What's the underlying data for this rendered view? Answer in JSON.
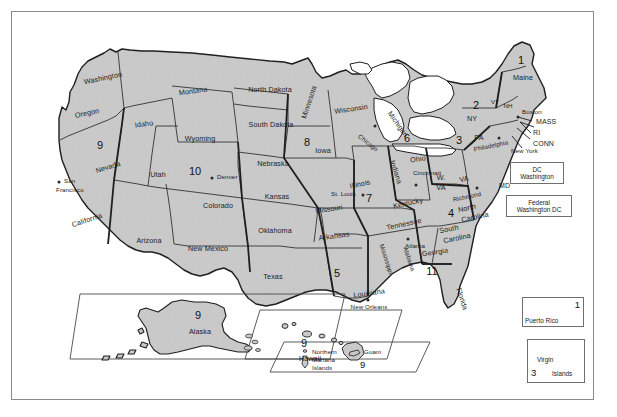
{
  "figure": {
    "kind": "map",
    "fill_color": "#c9c9c9",
    "outline_color": "#1f1f1f",
    "frame_color": "#8a8a8a",
    "background_color": "#ffffff"
  },
  "states": [
    {
      "name": "Washington",
      "x": 91,
      "y": 66,
      "rot": -12
    },
    {
      "name": "Oregon",
      "x": 75,
      "y": 101,
      "rot": -12
    },
    {
      "name": "Idaho",
      "x": 132,
      "y": 112,
      "rot": -8
    },
    {
      "name": "Montana",
      "x": 181,
      "y": 79,
      "rot": -8
    },
    {
      "name": "Wyoming",
      "x": 188,
      "y": 127,
      "rot": 0
    },
    {
      "name": "Nevada",
      "x": 96,
      "y": 155,
      "rot": -18
    },
    {
      "name": "Utah",
      "x": 146,
      "y": 163,
      "rot": 0
    },
    {
      "name": "Colorado",
      "x": 206,
      "y": 194,
      "rot": 0
    },
    {
      "name": "California",
      "x": 75,
      "y": 208,
      "rot": -18
    },
    {
      "name": "Arizona",
      "x": 137,
      "y": 229,
      "rot": 0
    },
    {
      "name": "New Mexico",
      "x": 196,
      "y": 237,
      "rot": 0
    },
    {
      "name": "Texas",
      "x": 261,
      "y": 265,
      "rot": 0
    },
    {
      "name": "North Dakota",
      "x": 258,
      "y": 78,
      "rot": 0
    },
    {
      "name": "South Dakota",
      "x": 259,
      "y": 113,
      "rot": 0
    },
    {
      "name": "Nebraska",
      "x": 261,
      "y": 152,
      "rot": 0
    },
    {
      "name": "Kansas",
      "x": 265,
      "y": 185,
      "rot": 0
    },
    {
      "name": "Oklahoma",
      "x": 263,
      "y": 219,
      "rot": 0
    },
    {
      "name": "Minnesota",
      "x": 297,
      "y": 90,
      "rot": -72
    },
    {
      "name": "Iowa",
      "x": 311,
      "y": 139,
      "rot": 0
    },
    {
      "name": "Missouri",
      "x": 317,
      "y": 197,
      "rot": -8
    },
    {
      "name": "Arkansas",
      "x": 322,
      "y": 224,
      "rot": -8
    },
    {
      "name": "Louisiana",
      "x": 357,
      "y": 281,
      "rot": -8
    },
    {
      "name": "Wisconsin",
      "x": 339,
      "y": 97,
      "rot": -8
    },
    {
      "name": "Illinois",
      "x": 348,
      "y": 172,
      "rot": -12
    },
    {
      "name": "Michigan",
      "x": 386,
      "y": 112,
      "rot": 62
    },
    {
      "name": "Indiana",
      "x": 384,
      "y": 160,
      "rot": 72
    },
    {
      "name": "Ohio",
      "x": 406,
      "y": 147,
      "rot": -8
    },
    {
      "name": "Kentucky",
      "x": 396,
      "y": 191,
      "rot": -12
    },
    {
      "name": "Tennessee",
      "x": 392,
      "y": 212,
      "rot": -12
    },
    {
      "name": "Mississippi",
      "x": 374,
      "y": 245,
      "rot": 78
    },
    {
      "name": "Alabama",
      "x": 396,
      "y": 245,
      "rot": 78
    },
    {
      "name": "Georgia",
      "x": 423,
      "y": 240,
      "rot": -8
    },
    {
      "name": "Florida",
      "x": 448,
      "y": 285,
      "rot": 72
    },
    {
      "name": "South",
      "x": 437,
      "y": 217,
      "rot": -12
    },
    {
      "name": "Carolina",
      "x": 444,
      "y": 225,
      "rot": -12
    },
    {
      "name": "North",
      "x": 455,
      "y": 196,
      "rot": -12
    },
    {
      "name": "Carolina2",
      "x": 463,
      "y": 205,
      "rot": -12
    },
    {
      "name": "VA",
      "x": 452,
      "y": 168,
      "rot": -12
    },
    {
      "name": "W.",
      "x": 429,
      "y": 167,
      "rot": 0
    },
    {
      "name": "VA2",
      "x": 429,
      "y": 177,
      "rot": 0
    },
    {
      "name": "PA",
      "x": 466,
      "y": 126,
      "rot": 0
    },
    {
      "name": "NY",
      "x": 460,
      "y": 107,
      "rot": 0
    },
    {
      "name": "Maine",
      "x": 511,
      "y": 66,
      "rot": 0
    },
    {
      "name": "VT",
      "x": 483,
      "y": 90,
      "rot": 0
    },
    {
      "name": "NH",
      "x": 495,
      "y": 93,
      "rot": 0
    },
    {
      "name": "MASS",
      "x": 534,
      "y": 110,
      "rot": 0
    },
    {
      "name": "RI",
      "x": 528,
      "y": 120,
      "rot": 0
    },
    {
      "name": "CONN",
      "x": 532,
      "y": 131,
      "rot": 0
    },
    {
      "name": "DEL",
      "x": 500,
      "y": 153,
      "rot": 0
    },
    {
      "name": "MD",
      "x": 492,
      "y": 173,
      "rot": 0
    }
  ],
  "state_labels": {
    "washington": "Washington",
    "oregon": "Oregon",
    "idaho": "Idaho",
    "montana": "Montana",
    "wyoming": "Wyoming",
    "nevada": "Nevada",
    "utah": "Utah",
    "colorado": "Colorado",
    "california": "California",
    "arizona": "Arizona",
    "new_mexico": "New Mexico",
    "texas": "Texas",
    "north_dakota": "North Dakota",
    "south_dakota": "South Dakota",
    "nebraska": "Nebraska",
    "kansas": "Kansas",
    "oklahoma": "Oklahoma",
    "minnesota": "Minnesota",
    "iowa": "Iowa",
    "missouri": "Missouri",
    "arkansas": "Arkansas",
    "louisiana": "Louisiana",
    "wisconsin": "Wisconsin",
    "illinois": "Illinois",
    "michigan": "Michigan",
    "indiana": "Indiana",
    "ohio": "Ohio",
    "kentucky": "Kentucky",
    "tennessee": "Tennessee",
    "mississippi": "Mississippi",
    "alabama": "Alabama",
    "georgia": "Georgia",
    "florida": "Florida",
    "south": "South",
    "carolina_s": "Carolina",
    "north": "North",
    "carolina_n": "Carolina",
    "virginia": "VA",
    "w": "W.",
    "va": "VA",
    "pennsylvania": "PA",
    "new_york_state": "NY",
    "maine": "Maine",
    "vermont": "VT",
    "new_hampshire": "NH",
    "massachusetts": "MASS",
    "rhode_island": "RI",
    "connecticut": "CONN",
    "delaware": "DEL",
    "maryland": "MD",
    "alaska": "Alaska",
    "hawaii": "Hawaii"
  },
  "cities": [
    {
      "name": "San Francisco",
      "label_line1": "San",
      "label_line2": "Francisco",
      "x": 55,
      "y": 172
    },
    {
      "name": "Denver",
      "label_line1": "Denver",
      "label_line2": "",
      "x": 204,
      "y": 166
    },
    {
      "name": "St. Louis",
      "label_line1": "St. Louis",
      "label_line2": "",
      "x": 330,
      "y": 183
    },
    {
      "name": "Chicago",
      "label_line1": "Chicago",
      "label_line2": "",
      "x": 363,
      "y": 118
    },
    {
      "name": "Cincinnati",
      "label_line1": "Cincinnati",
      "label_line2": "",
      "x": 409,
      "y": 165
    },
    {
      "name": "Philadelphia",
      "label_line1": "Philadelphia",
      "label_line2": "",
      "x": 488,
      "y": 133
    },
    {
      "name": "Richmond",
      "label_line1": "Richmond",
      "label_line2": "",
      "x": 462,
      "y": 185
    },
    {
      "name": "Atlanta",
      "label_line1": "Atlanta",
      "label_line2": "",
      "x": 402,
      "y": 230
    },
    {
      "name": "New Orleans",
      "label_line1": "New Orleans",
      "label_line2": "",
      "x": 356,
      "y": 292
    },
    {
      "name": "Boston",
      "label_line1": "Boston",
      "label_line2": "",
      "x": 512,
      "y": 100
    },
    {
      "name": "New York",
      "label_line1": "New York",
      "label_line2": "",
      "x": 503,
      "y": 137
    }
  ],
  "city_labels": {
    "san_francisco_1": "San",
    "san_francisco_2": "Francisco",
    "denver": "Denver",
    "st_louis": "St. Louis",
    "chicago": "Chicago",
    "cincinnati": "Cincinnati",
    "philadelphia": "Philadelphia",
    "richmond": "Richmond",
    "atlanta": "Atlanta",
    "new_orleans": "New Orleans",
    "boston": "Boston",
    "new_york": "New York"
  },
  "circuits": [
    {
      "number": "1",
      "label": "First Circuit",
      "x": 509,
      "y": 48
    },
    {
      "number": "2",
      "label": "Second Circuit",
      "x": 464,
      "y": 93
    },
    {
      "number": "3",
      "label": "Third Circuit",
      "x": 447,
      "y": 128
    },
    {
      "number": "4",
      "label": "Fourth Circuit",
      "x": 439,
      "y": 201
    },
    {
      "number": "5",
      "label": "Fifth Circuit",
      "x": 325,
      "y": 261
    },
    {
      "number": "6",
      "label": "Sixth Circuit",
      "x": 395,
      "y": 126
    },
    {
      "number": "7",
      "label": "Seventh Circuit",
      "x": 357,
      "y": 186
    },
    {
      "number": "8",
      "label": "Eighth Circuit",
      "x": 295,
      "y": 130
    },
    {
      "number": "9",
      "label": "Ninth Circuit",
      "x": 88,
      "y": 133
    },
    {
      "number": "10",
      "label": "Tenth Circuit",
      "x": 183,
      "y": 159
    },
    {
      "number": "11",
      "label": "Eleventh Circuit",
      "x": 420,
      "y": 259
    }
  ],
  "callouts": [
    {
      "id": "dc-circuit",
      "line1": "DC",
      "line2": "Washington",
      "x": 525,
      "y": 161,
      "w": 54,
      "h": 22
    },
    {
      "id": "federal-circuit",
      "line1": "Federal",
      "line2": "Washington DC",
      "x": 521,
      "y": 194,
      "w": 66,
      "h": 22
    }
  ],
  "insets": [
    {
      "id": "alaska",
      "title": "Alaska",
      "number": "9"
    },
    {
      "id": "hawaii",
      "title": "Hawaii",
      "number": "9"
    },
    {
      "id": "pacific",
      "title_line1": "Northern",
      "title_line2": "Mariana",
      "title_line3": "Islands",
      "second_label": "Guam",
      "number": "9"
    },
    {
      "id": "puerto-rico",
      "title": "Puerto Rico",
      "number": "1"
    },
    {
      "id": "virgin-islands",
      "title_line1": "Virgin",
      "title_line2": "Islands",
      "number": "3"
    }
  ]
}
